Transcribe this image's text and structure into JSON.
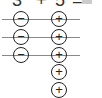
{
  "equation": {
    "left_operand": "3",
    "operator": "+",
    "right_operand": "5",
    "equals": "=",
    "answer": ""
  },
  "negative_chips": {
    "count": 3,
    "symbol": "−",
    "items": [
      "−",
      "−",
      "−"
    ]
  },
  "positive_chips": {
    "count": 5,
    "symbol": "+",
    "items": [
      "+",
      "+",
      "+",
      "+",
      "+"
    ]
  },
  "pair_lines": 3
}
